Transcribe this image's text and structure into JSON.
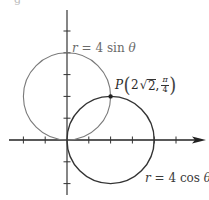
{
  "figure": {
    "top_fragment": "g",
    "axes": {
      "origin_px": [
        67,
        140
      ],
      "unit_px": 21.8,
      "x_ticks": [
        -2,
        -1,
        1,
        2,
        3,
        4,
        5
      ],
      "y_ticks": [
        -2,
        -1,
        1,
        2,
        3,
        4,
        5
      ],
      "x_axis_arrow": true,
      "y_axis_arrow": false,
      "axis_color": "#222222",
      "tick_color": "#333333"
    },
    "curves": [
      {
        "name": "r-4-sin-theta",
        "equation_label": "r = 4 sin θ",
        "center": [
          0,
          2
        ],
        "radius": 2,
        "color": "#7a7a7a",
        "stroke_width": 1.1
      },
      {
        "name": "r-4-cos-theta",
        "equation_label": "r = 4 cos θ",
        "center": [
          2,
          0
        ],
        "radius": 2,
        "color": "#333333",
        "stroke_width": 1.4
      }
    ],
    "intersection_point": {
      "name": "P",
      "cartesian": [
        2,
        2
      ],
      "polar_r": "2√2",
      "polar_r_coef": "2",
      "polar_r_radicand": "2",
      "polar_theta_num": "π",
      "polar_theta_den": "4",
      "color": "#222222"
    },
    "labels": {
      "sin_r": "r",
      "sin_rest": " = 4 sin ",
      "sin_theta": "θ",
      "cos_r": "r",
      "cos_rest": " = 4 cos ",
      "cos_theta": "θ",
      "p_name": "P",
      "p_open": "(",
      "p_close": ")",
      "p_comma": ", ",
      "sqrt_symbol": "√"
    }
  }
}
